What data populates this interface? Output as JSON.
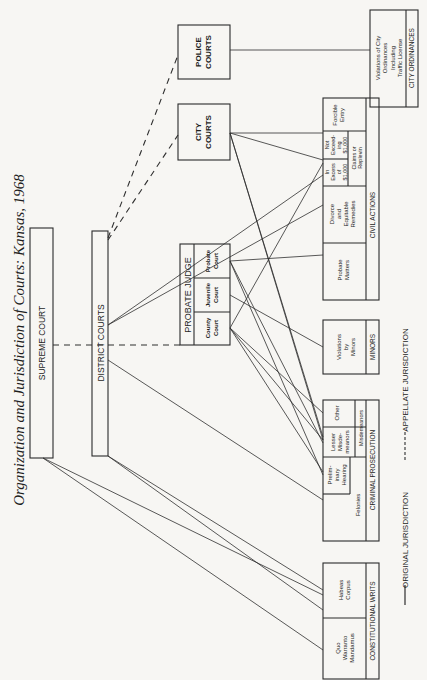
{
  "title": "Organization and Jurisdiction of Courts: Kansas, 1968",
  "courts": {
    "supreme": "SUPREME COURT",
    "district": "DISTRICT COURTS",
    "police": [
      "POLICE",
      "COURTS"
    ],
    "city": [
      "CITY",
      "COURTS"
    ],
    "probate_judge": {
      "header": "PROBATE JUDGE",
      "county": [
        "County",
        "Court"
      ],
      "juvenile": [
        "Juvenile",
        "Court"
      ],
      "probate": [
        "Probate",
        "Court"
      ]
    }
  },
  "categories": {
    "city_ordinances": {
      "label": "CITY ORDINANCES",
      "item": [
        "Violations of City",
        "Ordinances",
        "Including",
        "Traffic License"
      ]
    },
    "civil_actions": {
      "label": "CIVIL ACTIONS",
      "forcible_entry": [
        "Forcible",
        "Entry"
      ],
      "not_exceeding": [
        "Not",
        "Exceed-",
        "ing",
        "$1,000"
      ],
      "in_excess": [
        "In",
        "Excess",
        "of",
        "$1,000"
      ],
      "claims": [
        "Claims or",
        "Replevin"
      ],
      "divorce": [
        "Divorce",
        "and",
        "Equitable",
        "Remedies"
      ],
      "probate_matters": [
        "Probate",
        "Matters"
      ]
    },
    "minors": {
      "label": "MINORS",
      "item": [
        "Violations",
        "by",
        "Minors"
      ]
    },
    "criminal_prosecution": {
      "label": "CRIMINAL PROSECUTION",
      "misdemeanors_label": "Misdemeanors",
      "other": "Other",
      "lesser": [
        "Lesser",
        "Misde-",
        "meanors"
      ],
      "preliminary": [
        "Prelim-",
        "inary",
        "Hearing"
      ],
      "felonies": "Felonies"
    },
    "constitutional_writs": {
      "label": "CONSTITUTIONAL WRITS",
      "habeas": [
        "Habeas",
        "Corpus"
      ],
      "quo": [
        "Quo",
        "Warranto",
        "Mandamus"
      ]
    }
  },
  "legend": {
    "original": "ORIGINAL   JURISDICTION",
    "appellate": "APPELLATE   JURISDICTION"
  },
  "colors": {
    "ink": "#1e1e1e",
    "paper": "#f7f6f3"
  }
}
